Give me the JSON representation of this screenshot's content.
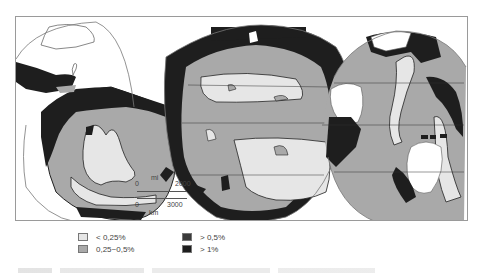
{
  "map": {
    "projection": "interrupted-homolosine",
    "lobes": [
      "indian-ocean",
      "pacific-ocean",
      "atlantic-ocean"
    ],
    "colors": {
      "low": "#e6e6e6",
      "medium": "#a9a9a9",
      "high": "#333333",
      "very_high": "#1e1e1e",
      "land": "#ffffff",
      "outline": "#8a8a8a"
    }
  },
  "scale_bar": {
    "top_unit": "mi",
    "top_start": "0",
    "top_end": "2000",
    "bottom_unit": "km",
    "bottom_start": "0",
    "bottom_end": "3000"
  },
  "legend": {
    "items": [
      {
        "label": "< 0,25%",
        "color": "#e6e6e6"
      },
      {
        "label": "0,25~0,5%",
        "color": "#a9a9a9"
      },
      {
        "label": "> 0,5%",
        "color": "#3a3a3a"
      },
      {
        "label": "> 1%",
        "color": "#1e1e1e"
      }
    ]
  }
}
